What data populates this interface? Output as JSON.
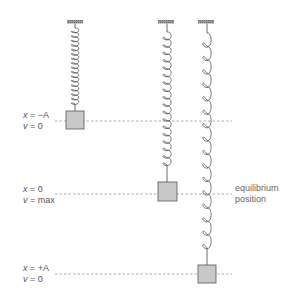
{
  "diagram": {
    "colors": {
      "spring": "#444444",
      "mass_fill": "#c8c8c8",
      "mass_stroke": "#555555",
      "mount": "#888888",
      "dashed_line": "#999999",
      "text": "#555555"
    },
    "positions": [
      {
        "id": "top",
        "x_label": "x = −A",
        "v_label": "v = 0",
        "x_var": "x",
        "x_val": "= −A",
        "v_var": "v",
        "v_val": "= 0"
      },
      {
        "id": "middle",
        "x_label": "x = 0",
        "v_label": "v = max",
        "x_var": "x",
        "x_val": "= 0",
        "v_var": "v",
        "v_val": "= max"
      },
      {
        "id": "bottom",
        "x_label": "x = +A",
        "v_label": "v = 0",
        "x_var": "x",
        "x_val": "= +A",
        "v_var": "v",
        "v_val": "= 0"
      }
    ],
    "equilibrium_label_line1": "equilibrium",
    "equilibrium_label_line2": "position",
    "springs": [
      {
        "name": "compressed",
        "state": "x = −A"
      },
      {
        "name": "equilibrium",
        "state": "x = 0"
      },
      {
        "name": "stretched",
        "state": "x = +A"
      }
    ]
  }
}
